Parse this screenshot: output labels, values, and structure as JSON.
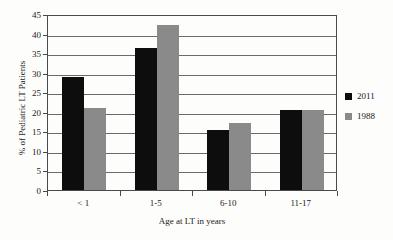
{
  "chart_data": {
    "type": "bar",
    "title": "",
    "subtitle": "",
    "xlabel": "Age at LT in years",
    "ylabel": "% of Pediatric LT Patients",
    "categories": [
      "< 1",
      "1-5",
      "6-10",
      "11-17"
    ],
    "series": [
      {
        "name": "2011",
        "color": "#0d0d0d",
        "values": [
          29.0,
          36.2,
          15.3,
          20.4
        ]
      },
      {
        "name": "1988",
        "color": "#8a8a8a",
        "values": [
          21.0,
          42.1,
          17.2,
          20.4
        ]
      }
    ],
    "ylim": [
      0,
      45
    ],
    "ytick_labels": [
      "0",
      "5",
      "10",
      "15",
      "20",
      "25",
      "30",
      "35",
      "40",
      "45"
    ],
    "ytick_values": [
      0,
      5,
      10,
      15,
      20,
      25,
      30,
      35,
      40,
      45
    ],
    "grid": "horizontal",
    "legend_position": "right",
    "legend": [
      {
        "label": "2011",
        "color": "#0d0d0d"
      },
      {
        "label": "1988",
        "color": "#8a8a8a"
      }
    ],
    "axis_color": "#4a4a4a",
    "gridline_color": "#6a6a6a",
    "background_color": "#fdfdfc"
  }
}
